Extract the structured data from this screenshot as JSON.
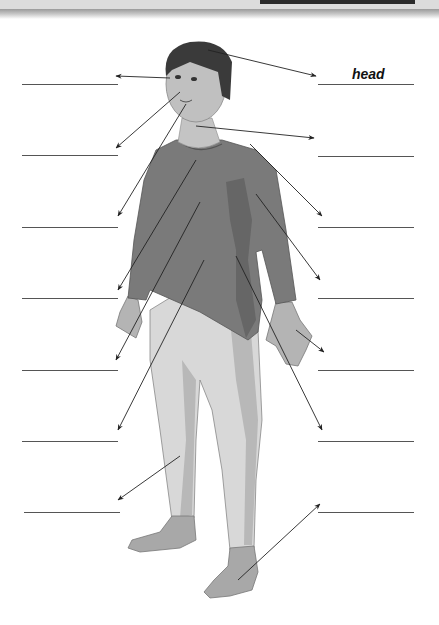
{
  "worksheet": {
    "title": "Parts of the body",
    "filled_labels": [
      {
        "side": "right",
        "row": 0,
        "text": "head"
      }
    ],
    "blank_lines": {
      "left": [
        {
          "y": 84
        },
        {
          "y": 155
        },
        {
          "y": 227
        },
        {
          "y": 298
        },
        {
          "y": 370
        },
        {
          "y": 441
        },
        {
          "y": 512
        }
      ],
      "right": [
        {
          "y": 84
        },
        {
          "y": 156
        },
        {
          "y": 227
        },
        {
          "y": 298
        },
        {
          "y": 370
        },
        {
          "y": 441
        },
        {
          "y": 512
        }
      ]
    }
  },
  "labels": {
    "head": "head"
  },
  "colors": {
    "shirt": "#7a7a7a",
    "shirt_shadow": "#666666",
    "trousers": "#d8d8d8",
    "trousers_shadow": "#b8b8b8",
    "skin": "#b4b4b4",
    "hair": "#3a3a3a",
    "line": "#555555",
    "arrow": "#222222"
  }
}
